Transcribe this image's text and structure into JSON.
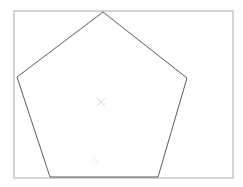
{
  "figure": {
    "canvas": {
      "width": 243,
      "height": 187,
      "background_color": "#ffffff"
    },
    "frame": {
      "label": "bounding-rectangle",
      "x": 14,
      "y": 11,
      "width": 219,
      "height": 167,
      "stroke_color": "#aaaaaa",
      "stroke_width": 1,
      "fill": "none"
    },
    "shape": {
      "label": "pentagon",
      "sides": 5,
      "stroke_color": "#4a4a4a",
      "stroke_width": 0.9,
      "fill": "none",
      "points": "103,12 187,78 158,177 50,177 17,77",
      "vertices": [
        {
          "name": "apex-top",
          "x": 103,
          "y": 12
        },
        {
          "name": "vertex-right",
          "x": 187,
          "y": 78
        },
        {
          "name": "vertex-bottom-right",
          "x": 158,
          "y": 177
        },
        {
          "name": "vertex-bottom-left",
          "x": 50,
          "y": 177
        },
        {
          "name": "vertex-left",
          "x": 17,
          "y": 77
        }
      ]
    },
    "centroid": {
      "label": "centroid-cross-marker",
      "x": 101,
      "y": 102,
      "arm_length": 4,
      "stroke_color": "#d8d8d8",
      "stroke_width": 1
    },
    "faint_mark": {
      "label": "faint-lower-mark",
      "x": 95,
      "y": 161,
      "radius": 2.5,
      "stroke_color": "#f2f2f2",
      "stroke_width": 1
    }
  }
}
